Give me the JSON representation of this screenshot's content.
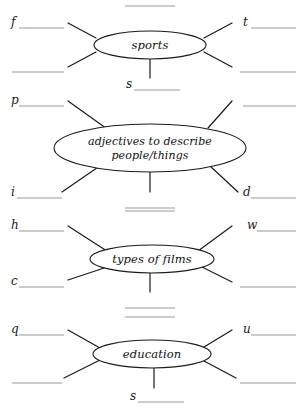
{
  "document": {
    "title": "Vocabulary Mind Map Worksheet",
    "page_background": "#ffffff",
    "ink_color": "#1a1a1a",
    "answer_line_color": "#9a9a9a"
  },
  "clusters": [
    {
      "id": "sports",
      "topic": "sports",
      "branches": [
        {
          "position": "top-left",
          "hint": "f"
        },
        {
          "position": "bottom-left",
          "hint": ""
        },
        {
          "position": "top-right",
          "hint": "t"
        },
        {
          "position": "bottom-right",
          "hint": ""
        },
        {
          "position": "bottom",
          "hint": "s"
        }
      ]
    },
    {
      "id": "adjectives",
      "topic": "adjectives to describe people/things",
      "topic_line_1": "adjectives to describe",
      "topic_line_2": "people/things",
      "branches": [
        {
          "position": "top-left",
          "hint": "p"
        },
        {
          "position": "bottom-left",
          "hint": "i"
        },
        {
          "position": "top-right",
          "hint": ""
        },
        {
          "position": "bottom-right",
          "hint": "d"
        },
        {
          "position": "bottom",
          "hint": ""
        }
      ]
    },
    {
      "id": "films",
      "topic": "types of films",
      "branches": [
        {
          "position": "top-left",
          "hint": "h"
        },
        {
          "position": "bottom-left",
          "hint": "c"
        },
        {
          "position": "top-right",
          "hint": "w"
        },
        {
          "position": "bottom-right",
          "hint": ""
        },
        {
          "position": "bottom",
          "hint": ""
        }
      ]
    },
    {
      "id": "education",
      "topic": "education",
      "branches": [
        {
          "position": "top-left",
          "hint": "q"
        },
        {
          "position": "bottom-left",
          "hint": ""
        },
        {
          "position": "top-right",
          "hint": "u"
        },
        {
          "position": "bottom-right",
          "hint": ""
        },
        {
          "position": "bottom",
          "hint": "s"
        }
      ]
    }
  ],
  "cut_off_header": "."
}
